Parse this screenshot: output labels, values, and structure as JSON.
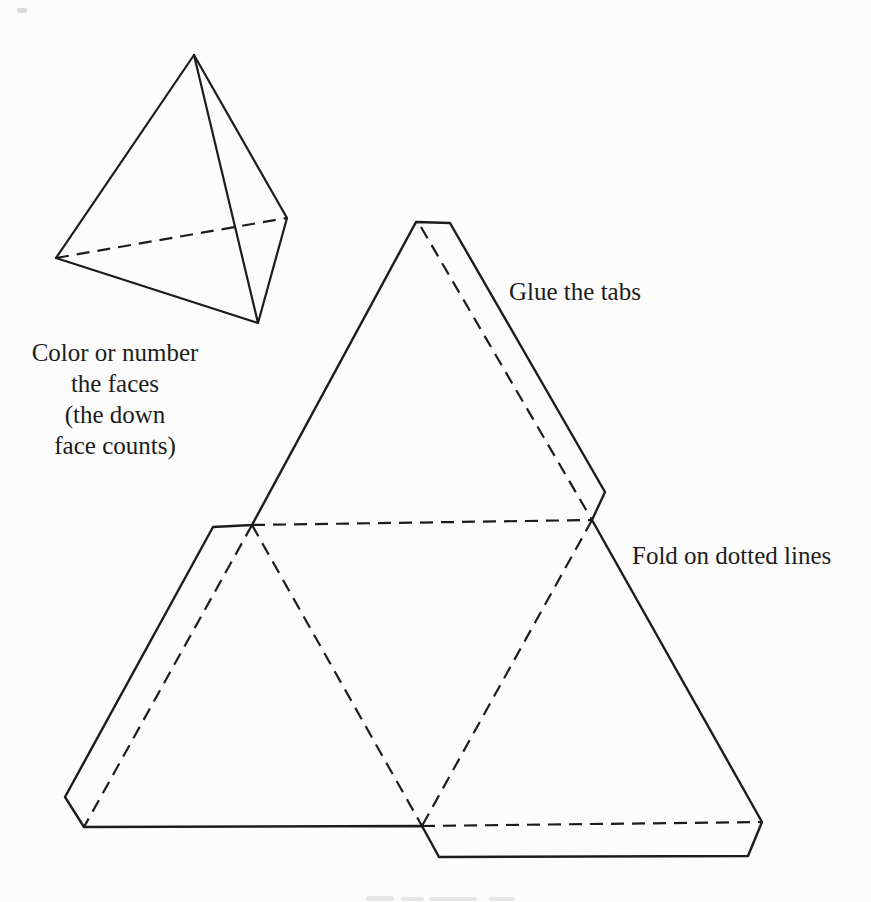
{
  "page": {
    "ink": "#1c1c1c",
    "paper": "#fcfcfc",
    "artifact_gray": "#bdbdbd"
  },
  "labels": {
    "glue_tabs": "Glue the tabs",
    "fold_on_dotted": "Fold on dotted lines",
    "color_note": {
      "lines": [
        "Color or number",
        "the faces",
        "(the down",
        "face counts)"
      ]
    }
  },
  "tetrahedron": {
    "vertices": {
      "apex": [
        194,
        55
      ],
      "left": [
        56,
        258
      ],
      "right": [
        287,
        218
      ],
      "bottom": [
        258,
        323
      ]
    },
    "solid_edges": [
      [
        "apex",
        "left"
      ],
      [
        "apex",
        "right"
      ],
      [
        "apex",
        "bottom"
      ],
      [
        "left",
        "bottom"
      ],
      [
        "bottom",
        "right"
      ]
    ],
    "dashed_edges": [
      [
        "left",
        "right"
      ]
    ]
  },
  "net": {
    "outline": [
      [
        416,
        222
      ],
      [
        252,
        525
      ],
      [
        213,
        527
      ],
      [
        65,
        797
      ],
      [
        84,
        827
      ],
      [
        422,
        826
      ],
      [
        439,
        857
      ],
      [
        748,
        856
      ],
      [
        762,
        822
      ],
      [
        592,
        520
      ],
      [
        605,
        492
      ],
      [
        450,
        223
      ]
    ],
    "fold_lines": [
      {
        "name": "fold-mid-horizontal",
        "from": [
          252,
          525
        ],
        "to": [
          592,
          520
        ]
      },
      {
        "name": "fold-center-left",
        "from": [
          252,
          525
        ],
        "to": [
          422,
          826
        ]
      },
      {
        "name": "fold-center-right",
        "from": [
          592,
          520
        ],
        "to": [
          422,
          826
        ]
      },
      {
        "name": "fold-top-tab",
        "from": [
          421,
          227
        ],
        "to": [
          592,
          520
        ]
      },
      {
        "name": "fold-left-tab",
        "from": [
          252,
          525
        ],
        "to": [
          84,
          827
        ]
      },
      {
        "name": "fold-bottom-tab",
        "from": [
          422,
          826
        ],
        "to": [
          762,
          822
        ]
      }
    ]
  },
  "artifacts": {
    "top_left_speck": [
      17,
      8,
      10,
      5
    ],
    "bottom_smudges": [
      [
        366,
        896,
        28,
        5
      ],
      [
        401,
        897,
        23,
        4
      ],
      [
        429,
        897,
        48,
        4
      ],
      [
        489,
        897,
        26,
        4
      ]
    ]
  }
}
